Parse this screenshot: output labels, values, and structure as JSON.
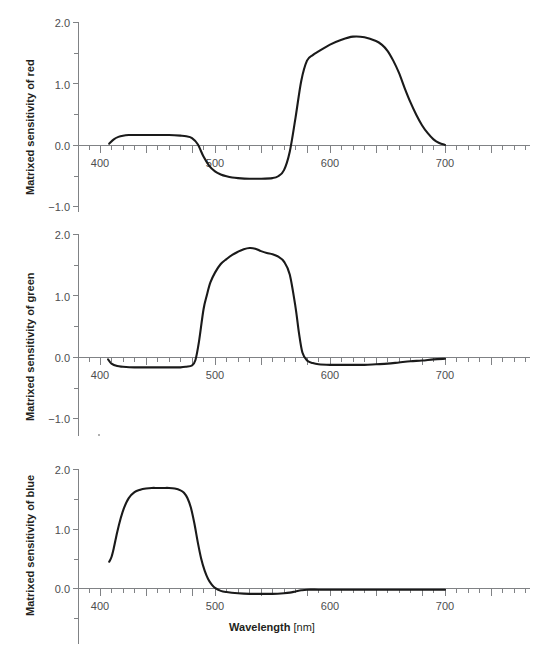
{
  "figure": {
    "xlabel_bold": "Wavelength",
    "xlabel_unit": "[nm]",
    "panels": [
      {
        "id": "red",
        "ylabel": "Matrixed sensitivity of red"
      },
      {
        "id": "green",
        "ylabel": "Matrixed sensitivity of green"
      },
      {
        "id": "blue",
        "ylabel": "Matrixed sensitivity of blue"
      }
    ]
  },
  "axis_text": {
    "x_ticks": [
      "400",
      "500",
      "600",
      "700"
    ],
    "y_ticks_rg": [
      "2.0",
      "1.0",
      "0.0",
      "−1.0"
    ],
    "y_ticks_b": [
      "2.0",
      "1.0",
      "0.0"
    ]
  },
  "chart_data": [
    {
      "type": "line",
      "title": "",
      "series_name": "Matrixed sensitivity of red",
      "xlabel": "Wavelength [nm]",
      "ylabel": "Matrixed sensitivity of red",
      "xlim": [
        390,
        715
      ],
      "ylim": [
        -1.0,
        2.0
      ],
      "xticks": [
        400,
        500,
        600,
        700
      ],
      "yticks": [
        -1.0,
        0.0,
        1.0,
        2.0
      ],
      "minor_xtick_step": 10,
      "minor_ytick_step": 0.5,
      "grid": false,
      "legend": "none",
      "line_color": "#1a1a1a",
      "x": [
        408,
        412,
        416,
        420,
        425,
        430,
        440,
        450,
        460,
        470,
        475,
        480,
        485,
        490,
        495,
        500,
        505,
        510,
        515,
        520,
        530,
        540,
        550,
        555,
        560,
        565,
        570,
        575,
        580,
        585,
        590,
        600,
        610,
        620,
        630,
        640,
        645,
        650,
        655,
        660,
        665,
        670,
        675,
        680,
        685,
        690,
        695,
        700
      ],
      "y": [
        0.03,
        0.1,
        0.14,
        0.16,
        0.17,
        0.17,
        0.17,
        0.17,
        0.17,
        0.16,
        0.15,
        0.12,
        0.02,
        -0.18,
        -0.33,
        -0.42,
        -0.47,
        -0.5,
        -0.52,
        -0.53,
        -0.54,
        -0.54,
        -0.53,
        -0.5,
        -0.4,
        -0.1,
        0.45,
        1.05,
        1.38,
        1.47,
        1.53,
        1.64,
        1.72,
        1.77,
        1.76,
        1.7,
        1.64,
        1.54,
        1.38,
        1.18,
        0.93,
        0.7,
        0.5,
        0.33,
        0.2,
        0.1,
        0.04,
        0.01
      ]
    },
    {
      "type": "line",
      "title": "",
      "series_name": "Matrixed sensitivity of green",
      "xlabel": "Wavelength [nm]",
      "ylabel": "Matrixed sensitivity of green",
      "xlim": [
        390,
        715
      ],
      "ylim": [
        -1.0,
        2.0
      ],
      "xticks": [
        400,
        500,
        600,
        700
      ],
      "yticks": [
        -1.0,
        0.0,
        1.0,
        2.0
      ],
      "minor_xtick_step": 10,
      "minor_ytick_step": 0.5,
      "grid": false,
      "legend": "none",
      "line_color": "#1a1a1a",
      "x": [
        407,
        410,
        415,
        420,
        430,
        440,
        450,
        460,
        470,
        475,
        480,
        483,
        486,
        490,
        493,
        496,
        500,
        505,
        510,
        515,
        520,
        525,
        530,
        535,
        540,
        545,
        550,
        555,
        560,
        565,
        570,
        573,
        576,
        580,
        585,
        590,
        600,
        610,
        620,
        630,
        640,
        650,
        660,
        670,
        680,
        690,
        700
      ],
      "y": [
        -0.03,
        -0.1,
        -0.14,
        -0.15,
        -0.16,
        -0.16,
        -0.16,
        -0.16,
        -0.16,
        -0.15,
        -0.13,
        -0.04,
        0.25,
        0.78,
        1.02,
        1.22,
        1.38,
        1.52,
        1.6,
        1.67,
        1.72,
        1.76,
        1.78,
        1.77,
        1.73,
        1.7,
        1.68,
        1.64,
        1.56,
        1.35,
        0.82,
        0.4,
        0.08,
        -0.05,
        -0.09,
        -0.11,
        -0.12,
        -0.12,
        -0.12,
        -0.12,
        -0.11,
        -0.1,
        -0.08,
        -0.06,
        -0.05,
        -0.03,
        -0.02
      ]
    },
    {
      "type": "line",
      "title": "",
      "series_name": "Matrixed sensitivity of blue",
      "xlabel": "Wavelength [nm]",
      "ylabel": "Matrixed sensitivity of blue",
      "xlim": [
        390,
        715
      ],
      "ylim": [
        0.0,
        2.0
      ],
      "xticks": [
        400,
        500,
        600,
        700
      ],
      "yticks": [
        0.0,
        1.0,
        2.0
      ],
      "minor_xtick_step": 10,
      "minor_ytick_step": 0.5,
      "grid": false,
      "legend": "none",
      "line_color": "#1a1a1a",
      "x": [
        408,
        410,
        412,
        415,
        418,
        421,
        425,
        430,
        435,
        440,
        445,
        450,
        455,
        460,
        465,
        470,
        473,
        476,
        479,
        482,
        485,
        488,
        491,
        494,
        497,
        500,
        505,
        510,
        520,
        530,
        540,
        550,
        560,
        565,
        570,
        575,
        580,
        590,
        600,
        620,
        640,
        660,
        680,
        700
      ],
      "y": [
        0.45,
        0.53,
        0.68,
        0.95,
        1.18,
        1.36,
        1.52,
        1.62,
        1.66,
        1.68,
        1.69,
        1.69,
        1.69,
        1.69,
        1.68,
        1.65,
        1.61,
        1.52,
        1.36,
        1.1,
        0.78,
        0.5,
        0.3,
        0.16,
        0.07,
        0.01,
        -0.04,
        -0.06,
        -0.08,
        -0.09,
        -0.09,
        -0.09,
        -0.08,
        -0.07,
        -0.05,
        -0.03,
        -0.02,
        -0.02,
        -0.02,
        -0.02,
        -0.02,
        -0.02,
        -0.02,
        -0.02
      ]
    }
  ]
}
